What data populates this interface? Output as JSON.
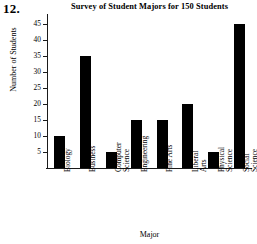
{
  "problem_number": "12.",
  "chart_data": {
    "type": "bar",
    "title": "Survey of Student Majors for 150 Students",
    "xlabel": "Major",
    "ylabel": "Number of Students",
    "categories": [
      "Biology",
      "Business",
      "Computer Science",
      "Engineering",
      "Fine Arts",
      "Liberal Arts",
      "Physical Science",
      "Social Science"
    ],
    "values": [
      10,
      35,
      5,
      15,
      15,
      20,
      5,
      45
    ],
    "ylim": [
      0,
      47
    ],
    "yticks": [
      5,
      10,
      15,
      20,
      25,
      30,
      35,
      40,
      45
    ],
    "ytick_labels": [
      "5",
      "10",
      "15",
      "20",
      "25",
      "30",
      "35",
      "40",
      "45"
    ],
    "grid": false,
    "legend": false,
    "bar_color": "#000000",
    "axis_color": "#1a1a1a"
  }
}
